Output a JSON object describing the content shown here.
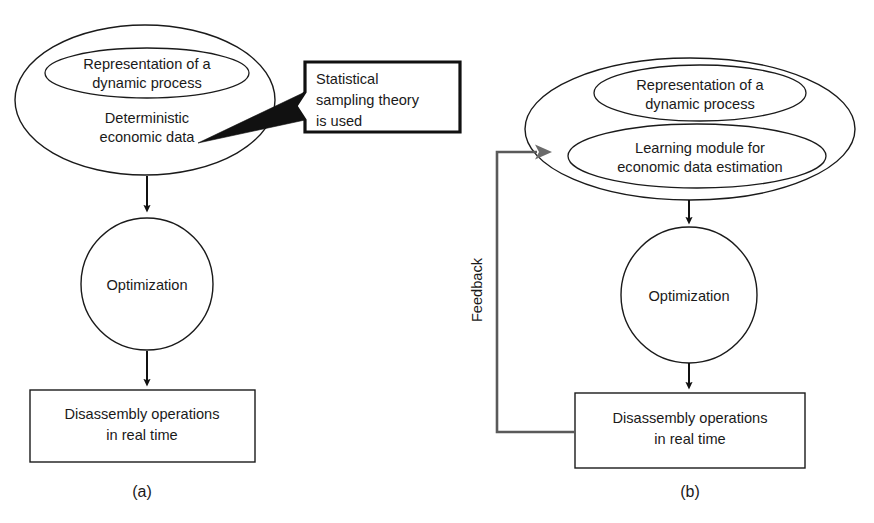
{
  "figure": {
    "title_present": false,
    "background_color": "#ffffff",
    "ink_color": "#1a1a1a",
    "feedback_line_color": "#5a5a5a",
    "panels": [
      {
        "caption": "(a)",
        "nodes": {
          "outer_ellipse_label_line1": "Deterministic",
          "outer_ellipse_label_line2": "economic data",
          "inner_ellipse_label_line1": "Representation of a",
          "inner_ellipse_label_line2": "dynamic process",
          "circle_label": "Optimization",
          "box_label_line1": "Disassembly operations",
          "box_label_line2": "in real time"
        },
        "callout": {
          "line1": "Statistical",
          "line2": "sampling theory",
          "line3": "is used"
        }
      },
      {
        "caption": "(b)",
        "nodes": {
          "inner_ellipse_1_label_line1": "Representation of a",
          "inner_ellipse_1_label_line2": "dynamic process",
          "inner_ellipse_2_label_line1": "Learning module for",
          "inner_ellipse_2_label_line2": "economic data estimation",
          "circle_label": "Optimization",
          "box_label_line1": "Disassembly operations",
          "box_label_line2": "in real time"
        },
        "feedback_label": "Feedback"
      }
    ]
  }
}
